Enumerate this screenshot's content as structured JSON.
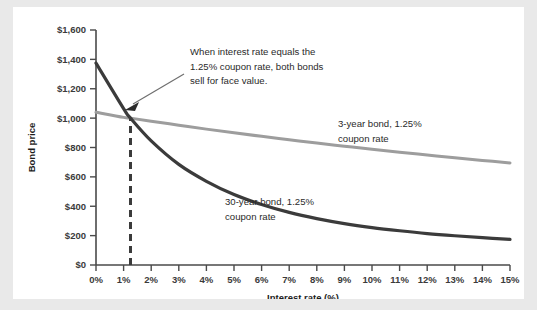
{
  "chart_data": {
    "type": "line",
    "title": "",
    "xlabel": "Interest rate (%)",
    "ylabel": "Bond price",
    "xlim": [
      0,
      15
    ],
    "ylim": [
      0,
      1600
    ],
    "grid": false,
    "legend_position": "inline-annotations",
    "x_tick_labels": [
      "0%",
      "1%",
      "2%",
      "3%",
      "4%",
      "5%",
      "6%",
      "7%",
      "8%",
      "9%",
      "10%",
      "11%",
      "12%",
      "13%",
      "14%",
      "15%"
    ],
    "x_tick_values": [
      0,
      1,
      2,
      3,
      4,
      5,
      6,
      7,
      8,
      9,
      10,
      11,
      12,
      13,
      14,
      15
    ],
    "y_tick_labels": [
      "$0",
      "$200",
      "$400",
      "$600",
      "$800",
      "$1,000",
      "$1,200",
      "$1,400",
      "$1,600"
    ],
    "y_tick_values": [
      0,
      200,
      400,
      600,
      800,
      1000,
      1200,
      1400,
      1600
    ],
    "x": [
      0,
      1,
      1.25,
      2,
      3,
      4,
      5,
      6,
      7,
      8,
      9,
      10,
      11,
      12,
      13,
      14,
      15
    ],
    "series": [
      {
        "name": "3-year bond, 1.25% coupon rate",
        "color": "#9d9d9d",
        "values": [
          1040,
          1005,
          1000,
          979,
          952,
          925,
          900,
          876,
          853,
          830,
          809,
          788,
          768,
          749,
          730,
          712,
          695
        ]
      },
      {
        "name": "30-year bond, 1.25% coupon rate",
        "color": "#3b3b3b",
        "values": [
          1375,
          1065,
          1000,
          845,
          685,
          570,
          480,
          412,
          358,
          316,
          282,
          255,
          233,
          214,
          199,
          186,
          175
        ]
      }
    ],
    "annotations": [
      {
        "name": "face-value-callout",
        "lines": [
          "When interest rate equals the",
          "1.25% coupon rate, both bonds",
          "sell for face value."
        ],
        "points_to": {
          "x": 1.25,
          "y": 1000
        }
      },
      {
        "name": "three-year-series-label",
        "lines": [
          "3-year bond, 1.25%",
          "coupon rate"
        ]
      },
      {
        "name": "thirty-year-series-label",
        "lines": [
          "30-year bond, 1.25%",
          "coupon rate"
        ]
      }
    ],
    "reference_line": {
      "name": "coupon-rate-marker",
      "style": "dashed",
      "color": "#3b3b3b",
      "x": 1.25,
      "y_from": 0,
      "y_to": 1000
    },
    "colors": {
      "background": "#e9e9e9",
      "panel": "#ffffff",
      "axis": "#4a4a4a",
      "text": "#2a2a2a"
    }
  }
}
